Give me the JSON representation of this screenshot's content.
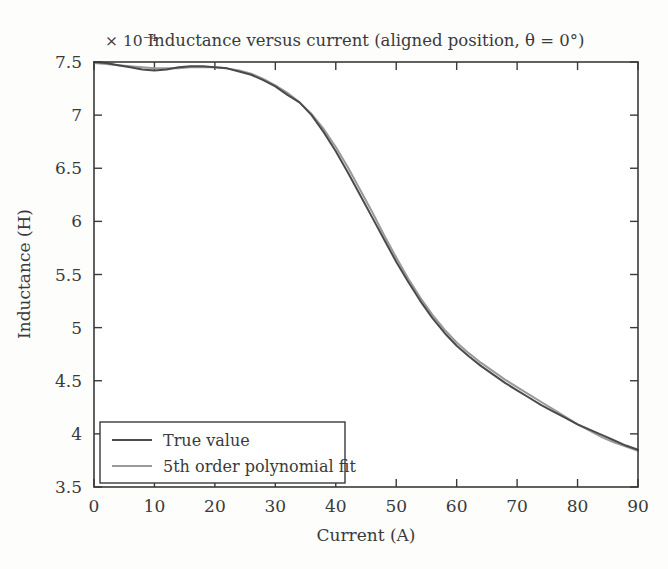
{
  "chart_data": {
    "type": "line",
    "title": "Inductance versus current (aligned position, θ = 0°)",
    "xlabel": "Current (A)",
    "ylabel": "Inductance (H)",
    "y_exponent_label": "× 10⁻⁴",
    "xlim": [
      0,
      90
    ],
    "ylim": [
      3.5,
      7.5
    ],
    "xticks": [
      0,
      10,
      20,
      30,
      40,
      50,
      60,
      70,
      80,
      90
    ],
    "yticks": [
      3.5,
      4,
      4.5,
      5,
      5.5,
      6,
      6.5,
      7,
      7.5
    ],
    "xtick_labels": [
      "0",
      "10",
      "20",
      "30",
      "40",
      "50",
      "60",
      "70",
      "80",
      "90"
    ],
    "ytick_labels": [
      "3.5",
      "4",
      "4.5",
      "5",
      "5.5",
      "6",
      "6.5",
      "7",
      "7.5"
    ],
    "grid": false,
    "legend_position": "lower left",
    "x": [
      0,
      2,
      4,
      6,
      8,
      10,
      12,
      14,
      16,
      18,
      20,
      22,
      24,
      26,
      28,
      30,
      32,
      34,
      36,
      38,
      40,
      42,
      44,
      46,
      48,
      50,
      52,
      54,
      56,
      58,
      60,
      62,
      64,
      66,
      68,
      70,
      72,
      74,
      76,
      78,
      80,
      82,
      84,
      86,
      88,
      90
    ],
    "series": [
      {
        "name": "True value",
        "color": "#4a4a4a",
        "linewidth": 2.0,
        "values": [
          7.5,
          7.49,
          7.47,
          7.45,
          7.43,
          7.42,
          7.43,
          7.45,
          7.46,
          7.46,
          7.45,
          7.44,
          7.41,
          7.38,
          7.33,
          7.27,
          7.19,
          7.12,
          7.0,
          6.84,
          6.66,
          6.46,
          6.25,
          6.04,
          5.83,
          5.62,
          5.43,
          5.25,
          5.09,
          4.95,
          4.83,
          4.73,
          4.64,
          4.56,
          4.48,
          4.41,
          4.34,
          4.27,
          4.21,
          4.15,
          4.09,
          4.04,
          3.99,
          3.94,
          3.89,
          3.85
        ]
      },
      {
        "name": "5th order polynomial fit",
        "color": "#9a9a9a",
        "linewidth": 2.0,
        "values": [
          7.49,
          7.48,
          7.47,
          7.46,
          7.45,
          7.44,
          7.44,
          7.44,
          7.45,
          7.45,
          7.45,
          7.44,
          7.42,
          7.39,
          7.34,
          7.28,
          7.21,
          7.12,
          7.01,
          6.87,
          6.7,
          6.51,
          6.3,
          6.09,
          5.87,
          5.66,
          5.46,
          5.28,
          5.12,
          4.98,
          4.86,
          4.76,
          4.67,
          4.59,
          4.51,
          4.44,
          4.37,
          4.3,
          4.23,
          4.16,
          4.09,
          4.03,
          3.97,
          3.92,
          3.88,
          3.84
        ]
      }
    ]
  },
  "legend": {
    "entries": [
      {
        "label": "True value"
      },
      {
        "label": "5th order polynomial fit"
      }
    ]
  }
}
